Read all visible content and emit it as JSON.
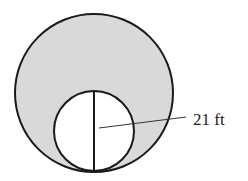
{
  "diagram": {
    "type": "geometry-circles",
    "outer_circle": {
      "fill": "#d9d9d9",
      "stroke": "#1a1a1a",
      "cx": 94,
      "cy": 93,
      "r": 79
    },
    "inner_circle": {
      "fill": "#ffffff",
      "stroke": "#1a1a1a",
      "cx": 94,
      "cy": 131,
      "r": 40
    },
    "diameter_line": {
      "x1": 94,
      "y1": 91,
      "x2": 94,
      "y2": 171
    },
    "leader_line": {
      "x1": 99,
      "y1": 128,
      "x2": 186,
      "y2": 117
    },
    "label": {
      "text": "21 ft",
      "x": 193,
      "y": 125
    }
  }
}
